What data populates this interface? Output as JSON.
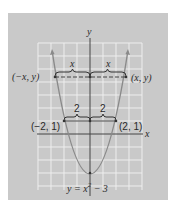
{
  "figure": {
    "panel_color": "#c9c9c9",
    "grid_color": "#eeeeee",
    "curve_color": "#8a8a8a",
    "axis_color": "#444444",
    "axis_labels": {
      "x": "x",
      "y": "y"
    },
    "equation": "y = x² − 3",
    "equation_parts": {
      "lhs": "y = x",
      "exp": "2",
      "rhs": " − 3"
    },
    "points": [
      {
        "label": "(−x, y)",
        "x": -2.75,
        "y": 4.56
      },
      {
        "label": "(x, y)",
        "x": 2.75,
        "y": 4.56
      },
      {
        "label": "(−2, 1)",
        "x": -2,
        "y": 1
      },
      {
        "label": "(2, 1)",
        "x": 2,
        "y": 1
      }
    ],
    "brace_labels": {
      "upper_left": "x",
      "upper_right": "x",
      "lower_left": "2",
      "lower_right": "2"
    },
    "vertex": {
      "x": 0,
      "y": -3
    }
  }
}
